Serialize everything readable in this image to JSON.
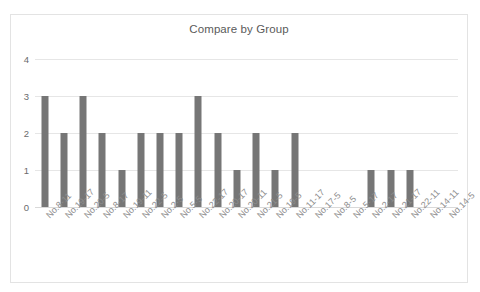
{
  "chart_data": {
    "type": "bar",
    "title": "Compare by Group",
    "xlabel": "",
    "ylabel": "",
    "ylim": [
      0,
      4
    ],
    "yticks": [
      0,
      1,
      2,
      3,
      4
    ],
    "grid": true,
    "legend": false,
    "bar_color": "#767676",
    "categories": [
      "No.8-11",
      "No.19-17",
      "No.20-5",
      "No.8-17",
      "No.19-11",
      "No.22-5",
      "No.2-5",
      "No.5-5",
      "No.22-17",
      "No.20-17",
      "No.20-11",
      "No.21-5",
      "No.19-5",
      "No.11-17",
      "No.17-5",
      "No.8-5",
      "No.5-17",
      "No.2-17",
      "No.21-17",
      "No.22-11",
      "No.14-11",
      "No.14-5"
    ],
    "values": [
      3,
      2,
      3,
      2,
      1,
      2,
      2,
      2,
      3,
      2,
      1,
      2,
      1,
      2,
      0,
      0,
      0,
      1,
      1,
      1,
      0,
      0
    ]
  },
  "axis": {
    "y_tick_labels": [
      "0",
      "1",
      "2",
      "3",
      "4"
    ]
  }
}
